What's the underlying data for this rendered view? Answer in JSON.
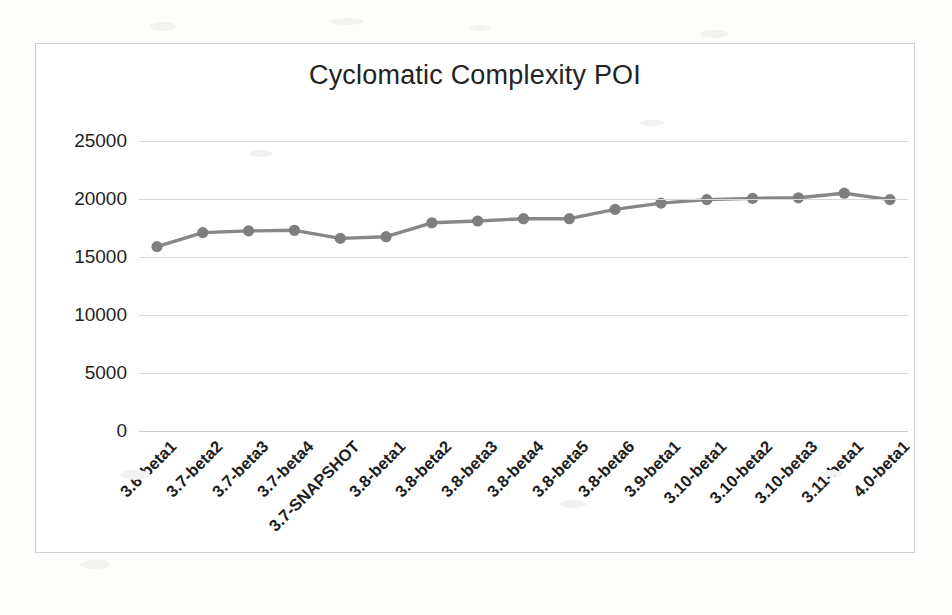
{
  "chart_data": {
    "type": "line",
    "title": "Cyclomatic Complexity POI",
    "xlabel": "",
    "ylabel": "",
    "ylim": [
      0,
      25000
    ],
    "yticks": [
      0,
      5000,
      10000,
      15000,
      20000,
      25000
    ],
    "ytick_labels": [
      "0",
      "5000",
      "10000",
      "15000",
      "20000",
      "25000"
    ],
    "grid": true,
    "legend": "none",
    "marker": "circle",
    "line_color": "#878787",
    "marker_color": "#7e7e7e",
    "categories": [
      "3.6-beta1",
      "3.7-beta2",
      "3.7-beta3",
      "3.7-beta4",
      "3.7-SNAPSHOT",
      "3.8-beta1",
      "3.8-beta2",
      "3.8-beta3",
      "3.8-beta4",
      "3.8-beta5",
      "3.8-beta6",
      "3.9-beta1",
      "3.10-beta1",
      "3.10-beta2",
      "3.10-beta3",
      "3.11-beta1",
      "4.0-beta1"
    ],
    "values": [
      15900,
      17100,
      17250,
      17300,
      16600,
      16750,
      17950,
      18100,
      18300,
      18300,
      19100,
      19650,
      19950,
      20050,
      20100,
      20500,
      19950
    ]
  },
  "figure": {
    "border_color": "#cfcfcf",
    "background": "#ffffff"
  }
}
